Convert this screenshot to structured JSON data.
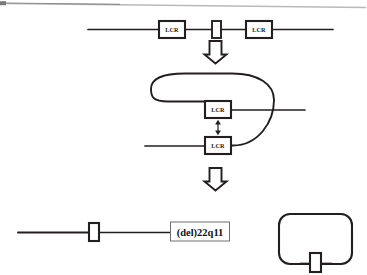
{
  "figure": {
    "ink_color": "#231f20",
    "background_color": "#ffffff",
    "scan_artifact_color": "#b9b9b9"
  },
  "panels": {
    "top": {
      "name": "normal-chromosome-22q11",
      "chromosome_line": {
        "x1": 88,
        "x2": 333,
        "y": 29
      },
      "elements": [
        {
          "type": "lcr-box",
          "label": "LCR",
          "x": 159,
          "y": 21,
          "w": 26,
          "h": 17
        },
        {
          "type": "gene-box",
          "label": "",
          "x": 212,
          "y": 21,
          "w": 9,
          "h": 17
        },
        {
          "type": "lcr-box",
          "label": "LCR",
          "x": 246,
          "y": 21,
          "w": 26,
          "h": 17
        }
      ]
    },
    "arrow_1": {
      "name": "block-arrow-down-1",
      "cx": 215,
      "top": 40,
      "height": 22
    },
    "middle": {
      "name": "looped-chromosome-misalignment",
      "loop": {
        "cx": 213,
        "cy": 107,
        "rx": 62,
        "ry": 35
      },
      "upper_line": {
        "x1": 222,
        "x2": 305,
        "y": 110
      },
      "lower_line": {
        "x1": 145,
        "x2": 222,
        "y": 146
      },
      "elements": [
        {
          "type": "lcr-box",
          "label": "LCR",
          "x": 205,
          "y": 101,
          "w": 26,
          "h": 17
        },
        {
          "type": "lcr-box",
          "label": "LCR",
          "x": 205,
          "y": 137,
          "w": 26,
          "h": 17
        }
      ],
      "pairing_arrow": {
        "name": "double-headed-pairing-arrow",
        "x": 218,
        "y1": 120,
        "y2": 135
      }
    },
    "arrow_2": {
      "name": "block-arrow-down-2",
      "cx": 215,
      "top": 167,
      "height": 22
    },
    "bottom_left": {
      "name": "deleted-chromosome-22",
      "chromosome_line": {
        "x1": 18,
        "x2": 170,
        "y": 232
      },
      "elements": [
        {
          "type": "gene-box",
          "label": "",
          "x": 89,
          "y": 223,
          "w": 10,
          "h": 18
        }
      ],
      "callout": {
        "label": "(del)22q11",
        "x": 170,
        "y": 222,
        "w": 59,
        "h": 19
      }
    },
    "bottom_right": {
      "name": "ring-or-excised-circle-product",
      "ring": {
        "x": 279,
        "y": 214,
        "w": 73,
        "h": 50,
        "radius": 11
      },
      "elements": [
        {
          "type": "gene-box",
          "label": "",
          "x": 310,
          "y": 253,
          "w": 11,
          "h": 19
        }
      ]
    }
  },
  "legend": {
    "lcr_text": "LCR",
    "deletion_text": "(del)22q11"
  }
}
